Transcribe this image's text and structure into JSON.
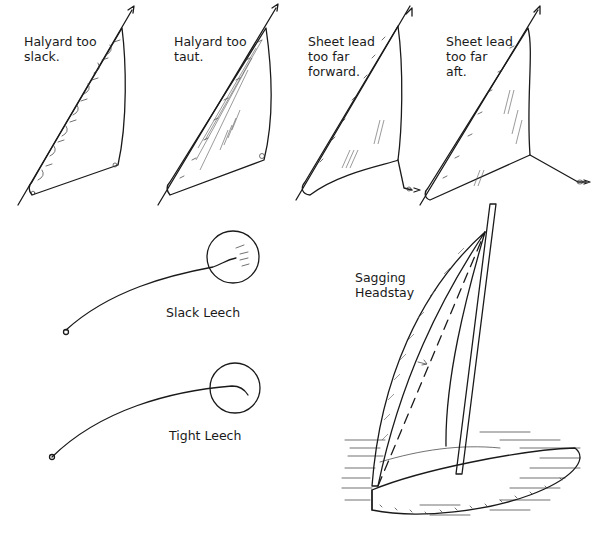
{
  "panels": [
    {
      "id": "halyard-slack",
      "caption": "Halyard too\nslack."
    },
    {
      "id": "halyard-taut",
      "caption": "Halyard too\ntaut."
    },
    {
      "id": "sheet-forward",
      "caption": "Sheet lead\ntoo far\nforward."
    },
    {
      "id": "sheet-aft",
      "caption": "Sheet lead\ntoo far\naft."
    }
  ],
  "leech": {
    "slack_label": "Slack Leech",
    "tight_label": "Tight Leech"
  },
  "boat": {
    "label": "Sagging\nHeadstay"
  },
  "colors": {
    "ink": "#1a1a1a",
    "background": "#ffffff"
  }
}
